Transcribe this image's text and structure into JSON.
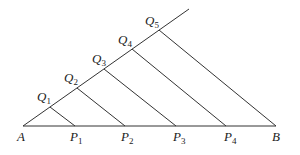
{
  "diagram": {
    "type": "geometry",
    "points": {
      "A": {
        "label": "A",
        "x": 23,
        "y": 126
      },
      "B": {
        "label": "B",
        "x": 276,
        "y": 126
      },
      "P": [
        {
          "label": "P",
          "sub": "1",
          "x": 75,
          "y": 126
        },
        {
          "label": "P",
          "sub": "2",
          "x": 125,
          "y": 126
        },
        {
          "label": "P",
          "sub": "3",
          "x": 176,
          "y": 126
        },
        {
          "label": "P",
          "sub": "4",
          "x": 226,
          "y": 126
        }
      ],
      "Q": [
        {
          "label": "Q",
          "sub": "1",
          "x": 50,
          "y": 107
        },
        {
          "label": "Q",
          "sub": "2",
          "x": 77,
          "y": 88
        },
        {
          "label": "Q",
          "sub": "3",
          "x": 104,
          "y": 69
        },
        {
          "label": "Q",
          "sub": "4",
          "x": 132,
          "y": 49
        },
        {
          "label": "Q",
          "sub": "5",
          "x": 159,
          "y": 30
        }
      ],
      "ray_end": {
        "x": 189,
        "y": 9
      }
    },
    "colors": {
      "stroke": "#333333",
      "text": "#222222",
      "background": "#ffffff"
    }
  }
}
